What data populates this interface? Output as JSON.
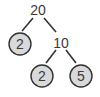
{
  "diagram": {
    "type": "factor-tree",
    "colors": {
      "leaf_fill": "#d9d9d9",
      "stroke": "#333333",
      "text": "#3a3a3a"
    },
    "nodes": [
      {
        "id": "root",
        "value": "20",
        "prime": false
      },
      {
        "id": "left",
        "value": "2",
        "prime": true
      },
      {
        "id": "mid",
        "value": "10",
        "prime": false
      },
      {
        "id": "midleft",
        "value": "2",
        "prime": true
      },
      {
        "id": "midright",
        "value": "5",
        "prime": true
      }
    ],
    "edges": [
      [
        "root",
        "left"
      ],
      [
        "root",
        "mid"
      ],
      [
        "mid",
        "midleft"
      ],
      [
        "mid",
        "midright"
      ]
    ]
  }
}
